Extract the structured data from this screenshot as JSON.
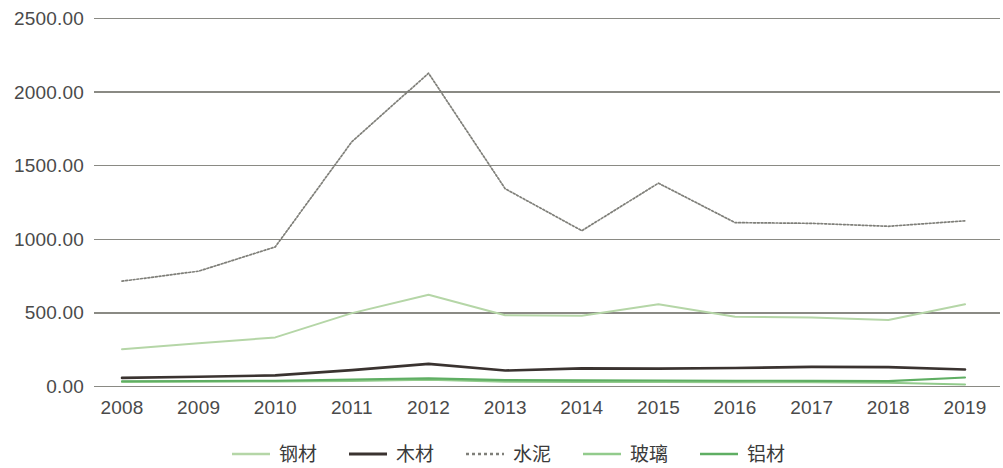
{
  "chart_data": {
    "type": "line",
    "title": "",
    "xlabel": "",
    "ylabel": "",
    "categories": [
      "2008",
      "2009",
      "2010",
      "2011",
      "2012",
      "2013",
      "2014",
      "2015",
      "2016",
      "2017",
      "2018",
      "2019"
    ],
    "ylim": [
      0,
      2500
    ],
    "y_ticks": [
      "0.00",
      "500.00",
      "1000.00",
      "1500.00",
      "2000.00",
      "2500.00"
    ],
    "y_tick_values": [
      0,
      500,
      1000,
      1500,
      2000,
      2500
    ],
    "grid": true,
    "legend_position": "bottom",
    "series": [
      {
        "name": "钢材",
        "color": "#b5d6a7",
        "width": 2.0,
        "dash": "none",
        "values": [
          250,
          290,
          330,
          495,
          620,
          480,
          478,
          555,
          470,
          465,
          448,
          555
        ]
      },
      {
        "name": "木材",
        "color": "#3a3330",
        "width": 2.6,
        "dash": "none",
        "values": [
          55,
          63,
          72,
          108,
          150,
          105,
          120,
          118,
          122,
          130,
          128,
          112
        ]
      },
      {
        "name": "水泥",
        "color": "#7f7f79",
        "width": 1.7,
        "dash": "dotted",
        "values": [
          712,
          780,
          945,
          1660,
          2125,
          1340,
          1055,
          1378,
          1110,
          1105,
          1085,
          1122
        ]
      },
      {
        "name": "玻璃",
        "color": "#92cb8c",
        "width": 2.1,
        "dash": "none",
        "values": [
          28,
          30,
          31,
          35,
          42,
          30,
          28,
          27,
          26,
          25,
          22,
          10
        ]
      },
      {
        "name": "铝材",
        "color": "#5fae63",
        "width": 2.1,
        "dash": "none",
        "values": [
          32,
          34,
          36,
          44,
          52,
          40,
          38,
          37,
          36,
          35,
          33,
          58
        ]
      }
    ]
  },
  "legend": {
    "items": [
      {
        "label": "钢材",
        "color": "#b5d6a7",
        "dash": "none"
      },
      {
        "label": "木材",
        "color": "#3a3330",
        "dash": "none"
      },
      {
        "label": "水泥",
        "color": "#7f7f79",
        "dash": "dotted"
      },
      {
        "label": "玻璃",
        "color": "#92cb8c",
        "dash": "none"
      },
      {
        "label": "铝材",
        "color": "#5fae63",
        "dash": "none"
      }
    ]
  },
  "colors": {
    "grid": "#8a8a84",
    "text": "#4a4a4a",
    "background": "#ffffff"
  }
}
